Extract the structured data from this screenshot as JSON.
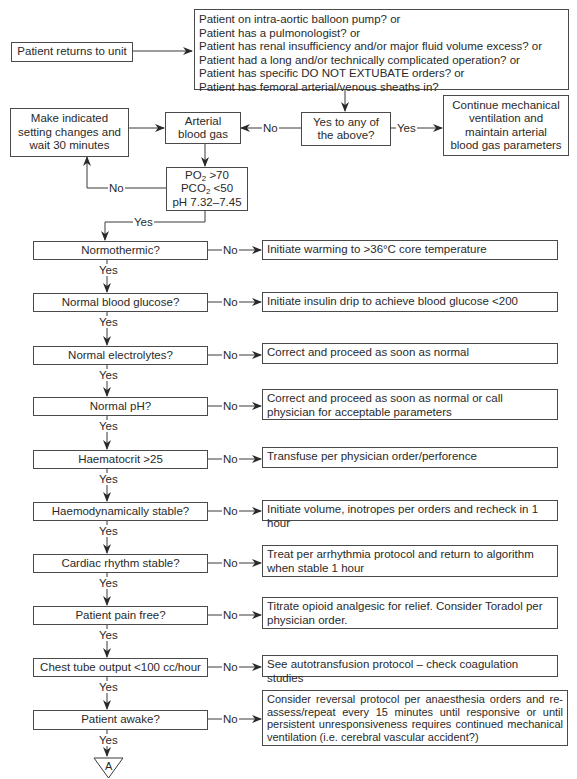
{
  "flowchart": {
    "start": {
      "label": "Patient returns to unit"
    },
    "criteria": {
      "lines": [
        "Patient on intra-aortic balloon pump? or",
        "Patient has a pulmonologist? or",
        "Patient has renal insufficiency and/or major fluid volume excess? or",
        "Patient had a long and/or technically complicated operation? or",
        "Patient has specific DO NOT EXTUBATE orders? or",
        "Patient has femoral arterial/venous sheaths in?"
      ]
    },
    "yes_to_any": {
      "label": "Yes to any of the above?"
    },
    "continue_ventilation": {
      "label": "Continue mechanical ventilation and maintain arterial blood gas parameters"
    },
    "arterial_blood_gas": {
      "label": "Arterial blood gas"
    },
    "make_changes": {
      "label": "Make indicated setting changes and wait 30 minutes"
    },
    "abg_criteria": {
      "po2_prefix": "PO",
      "po2_sub": "2",
      "po2_value": " >70",
      "pco2_prefix": "PCO",
      "pco2_sub": "2",
      "pco2_value": " <50",
      "ph": "pH 7.32–7.45"
    },
    "labels": {
      "yes": "Yes",
      "no": "No"
    },
    "steps": [
      {
        "question": "Normothermic?",
        "action": "Initiate warming to >36°C core temperature"
      },
      {
        "question": "Normal blood glucose?",
        "action": "Initiate insulin drip to achieve blood glucose <200"
      },
      {
        "question": "Normal electrolytes?",
        "action": "Correct and proceed as soon as normal"
      },
      {
        "question": "Normal pH?",
        "action": "Correct and proceed as soon as normal or call physician for acceptable parameters"
      },
      {
        "question": "Haematocrit >25",
        "action": "Transfuse per physician order/perforence"
      },
      {
        "question": "Haemodynamically stable?",
        "action": "Initiate volume, inotropes per orders and recheck in 1 hour"
      },
      {
        "question": "Cardiac rhythm stable?",
        "action": "Treat per arrhythmia protocol and return to algorithm when stable 1 hour"
      },
      {
        "question": "Patient pain free?",
        "action": "Titrate opioid analgesic for relief. Consider Toradol per physician order."
      },
      {
        "question": "Chest tube output <100 cc/hour",
        "action": "See autotransfusion protocol – check coagulation studies"
      },
      {
        "question": "Patient awake?",
        "action": "Consider reversal protocol per anaesthesia orders and re-assess/repeat every 15 minutes until responsive or until persistent unresponsiveness requires continued mechanical ventilation (i.e. cerebral vascular accident?)"
      }
    ],
    "connector": {
      "label": "A"
    }
  }
}
